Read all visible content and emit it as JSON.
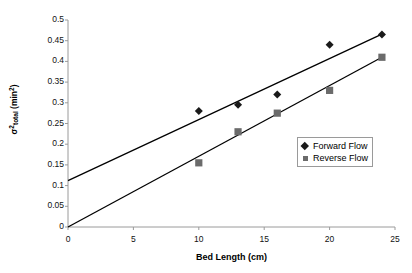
{
  "chart_data": {
    "type": "scatter",
    "title": "",
    "xlabel": "Bed Length (cm)",
    "ylabel": "σ²total (min²)",
    "ylabel_parts": {
      "sigma": "σ",
      "sigma_exp": "2",
      "sigma_sub": "total",
      "unit_open": " (min",
      "unit_exp": "2",
      "unit_close": ")"
    },
    "xlim": [
      0,
      25
    ],
    "ylim": [
      0,
      0.5
    ],
    "xticks": [
      0,
      5,
      10,
      15,
      20,
      25
    ],
    "xtick_labels": [
      "0",
      "5",
      "10",
      "15",
      "20",
      "25"
    ],
    "yticks": [
      0,
      0.05,
      0.1,
      0.15,
      0.2,
      0.25,
      0.3,
      0.35,
      0.4,
      0.45,
      0.5
    ],
    "ytick_labels": [
      "0",
      "0.05",
      "0.1",
      "0.15",
      "0.2",
      "0.25",
      "0.3",
      "0.35",
      "0.4",
      "0.45",
      "0.5"
    ],
    "grid": false,
    "legend_position": "center-right",
    "series": [
      {
        "name": "Forward Flow",
        "marker": "diamond",
        "color": "#1a1a1a",
        "x": [
          10,
          13,
          16,
          20,
          24
        ],
        "values": [
          0.28,
          0.295,
          0.32,
          0.44,
          0.465
        ],
        "trendline": {
          "intercept": 0.112,
          "slope": 0.01475,
          "x_start": 0,
          "x_end": 24
        }
      },
      {
        "name": "Reverse Flow",
        "marker": "square",
        "color": "#6b6b6b",
        "x": [
          10,
          13,
          16,
          20,
          24
        ],
        "values": [
          0.155,
          0.23,
          0.275,
          0.33,
          0.41
        ],
        "trendline": {
          "intercept": 0.0,
          "slope": 0.01708,
          "x_start": 0,
          "x_end": 24
        }
      }
    ]
  },
  "legend": {
    "items": [
      {
        "label": "Forward Flow",
        "marker": "diamond"
      },
      {
        "label": "Reverse Flow",
        "marker": "square"
      }
    ]
  },
  "colors": {
    "forward": "#1a1a1a",
    "reverse": "#6b6b6b",
    "axis": "#9a9a9a",
    "trendline": "#000000"
  }
}
